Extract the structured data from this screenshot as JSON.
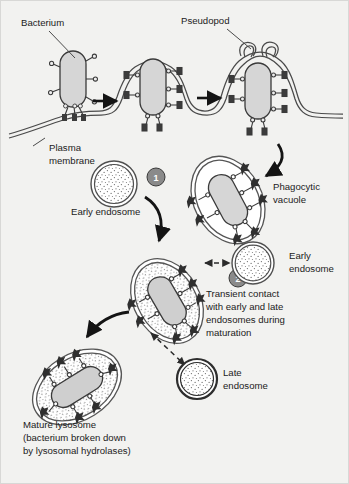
{
  "figure": {
    "background_color": "#f2f2f0",
    "border_color": "#d8d8d6",
    "ink_color": "#1b1b1b",
    "bacterium_fill": "#d9d9d9",
    "membrane_fill": "#b5b5b5",
    "lumen_fill": "#ffffff"
  },
  "labels": {
    "bacterium": "Bacterium",
    "pseudopod": "Pseudopod",
    "plasma_membrane_line1": "Plasma",
    "plasma_membrane_line2": "membrane",
    "early_endosome_top": "Early endosome",
    "phagocytic_vacuole_line1": "Phagocytic",
    "phagocytic_vacuole_line2": "vacuole",
    "early_endosome_mid_line1": "Early",
    "early_endosome_mid_line2": "endosome",
    "transient_line1": "Transient contact",
    "transient_line2": "with early and late",
    "transient_line3": "endosomes during",
    "transient_line4": "maturation",
    "late_endosome_line1": "Late",
    "late_endosome_line2": "endosome",
    "mature_lysosome_line1": "Mature lysosome",
    "mature_lysosome_line2": "(bacterium broken down",
    "mature_lysosome_line3": "by lysosomal hydrolases)"
  },
  "step_markers": [
    {
      "id": "step-1",
      "number": "1",
      "cx": 155,
      "cy": 176
    },
    {
      "id": "step-2",
      "number": "2",
      "cx": 237,
      "cy": 277
    }
  ],
  "stages": [
    {
      "id": "stage-attachment",
      "name": "bacterium-attached-to-membrane",
      "description": "Bacterium binds surface receptors on the plasma membrane"
    },
    {
      "id": "stage-engulfment",
      "name": "membrane-invagination",
      "description": "Plasma membrane invaginates around the bacterium"
    },
    {
      "id": "stage-pseudopod",
      "name": "pseudopod-closure",
      "description": "Pseudopods extend and fuse enclosing the bacterium"
    },
    {
      "id": "stage-vacuole",
      "name": "phagocytic-vacuole",
      "description": "Internalized phagocytic vacuole with clear lumen"
    },
    {
      "id": "stage-maturing",
      "name": "maturing-phagosome",
      "description": "Phagosome acquires endosomal content during maturation"
    },
    {
      "id": "stage-lysosome",
      "name": "mature-lysosome",
      "description": "Mature lysosome degrading the bacterium"
    }
  ],
  "organelles": [
    {
      "id": "early-endosome-top",
      "type": "early-endosome",
      "cx": 113,
      "cy": 183,
      "r": 23
    },
    {
      "id": "early-endosome-mid",
      "type": "early-endosome",
      "cx": 252,
      "cy": 262,
      "r": 21
    },
    {
      "id": "late-endosome",
      "type": "late-endosome",
      "cx": 196,
      "cy": 378,
      "r": 20
    }
  ],
  "arrows": [
    {
      "id": "arrow-stage1-to-2",
      "kind": "straight",
      "from": "stage-attachment",
      "to": "stage-engulfment"
    },
    {
      "id": "arrow-stage2-to-3",
      "kind": "straight",
      "from": "stage-engulfment",
      "to": "stage-pseudopod"
    },
    {
      "id": "arrow-pseudopod-to-vacuole",
      "kind": "curved",
      "from": "stage-pseudopod",
      "to": "stage-vacuole"
    },
    {
      "id": "arrow-vacuole-to-maturing",
      "kind": "curved",
      "from": "stage-vacuole",
      "to": "stage-maturing"
    },
    {
      "id": "arrow-maturing-to-lysosome",
      "kind": "curved",
      "from": "stage-maturing",
      "to": "stage-lysosome"
    },
    {
      "id": "arrow-early-endosome-contact",
      "kind": "dashed-double",
      "from": "stage-maturing",
      "to": "early-endosome-mid"
    },
    {
      "id": "arrow-late-endosome-contact",
      "kind": "dashed-double",
      "from": "stage-maturing",
      "to": "late-endosome"
    }
  ]
}
